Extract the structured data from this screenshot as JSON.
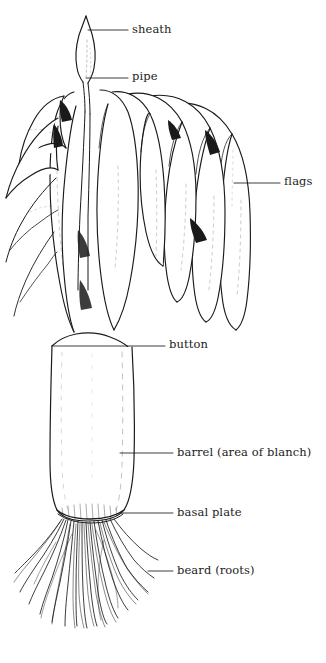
{
  "figure": {
    "background_color": "#ffffff",
    "ink_color": "#1a1a1a",
    "width": 326,
    "height": 663
  },
  "labels": [
    {
      "id": "sheath",
      "text": "sheath",
      "text_x": 132,
      "text_y": 24,
      "leader": {
        "x1": 88,
        "y1": 30,
        "x2": 128,
        "y2": 30
      }
    },
    {
      "id": "pipe",
      "text": "pipe",
      "text_x": 132,
      "text_y": 71,
      "leader": {
        "x1": 86,
        "y1": 78,
        "x2": 128,
        "y2": 78
      }
    },
    {
      "id": "flags",
      "text": "flags",
      "text_x": 284,
      "text_y": 176,
      "leader": {
        "x1": 234,
        "y1": 183,
        "x2": 280,
        "y2": 183
      }
    },
    {
      "id": "button",
      "text": "button",
      "text_x": 169,
      "text_y": 339,
      "leader": {
        "x1": 52,
        "y1": 346,
        "x2": 165,
        "y2": 346
      }
    },
    {
      "id": "barrel",
      "text": "barrel (area of blanch)",
      "text_x": 177,
      "text_y": 447,
      "leader": {
        "x1": 120,
        "y1": 453,
        "x2": 173,
        "y2": 453
      }
    },
    {
      "id": "basal-plate",
      "text": "basal plate",
      "text_x": 177,
      "text_y": 507,
      "leader": {
        "x1": 120,
        "y1": 513,
        "x2": 173,
        "y2": 513
      }
    },
    {
      "id": "beard-roots",
      "text": "beard (roots)",
      "text_x": 177,
      "text_y": 565,
      "leader": {
        "x1": 148,
        "y1": 571,
        "x2": 173,
        "y2": 571
      }
    }
  ]
}
